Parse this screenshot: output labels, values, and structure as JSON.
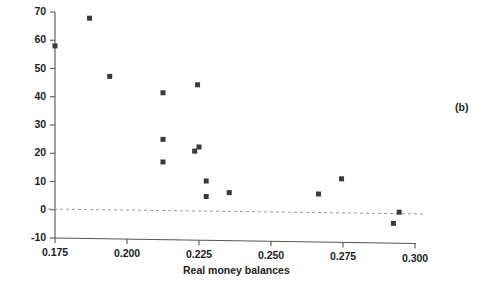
{
  "panel": {
    "tag": "(b)"
  },
  "chart_data": {
    "type": "scatter",
    "title": "",
    "xlabel": "Real money balances",
    "ylabel": "Monthly inflation rate (percent)",
    "xlim": [
      0.175,
      0.3
    ],
    "ylim": [
      -10,
      70
    ],
    "xticks": [
      0.175,
      0.2,
      0.225,
      0.25,
      0.275,
      0.3
    ],
    "xtick_labels": [
      "0.175",
      "0.200",
      "0.225",
      "0.250",
      "0.275",
      "0.300"
    ],
    "yticks": [
      -10,
      0,
      10,
      20,
      30,
      40,
      50,
      60,
      70
    ],
    "ytick_labels": [
      "-10",
      "0",
      "10",
      "20",
      "30",
      "40",
      "50",
      "60",
      "70"
    ],
    "grid": false,
    "legend": null,
    "reference_lines": [
      {
        "name": "zero-line",
        "axis": "y",
        "value": 0,
        "style": "dashed"
      }
    ],
    "marker": {
      "shape": "square",
      "color": "#3a3a3a",
      "size": 5
    },
    "x": [
      0.175,
      0.187,
      0.194,
      0.2125,
      0.2125,
      0.2125,
      0.2235,
      0.225,
      0.2245,
      0.2275,
      0.2275,
      0.2355,
      0.2665,
      0.2745,
      0.2925,
      0.2945
    ],
    "y": [
      58,
      68,
      47.5,
      42,
      25.5,
      17.5,
      21.5,
      23,
      45,
      11,
      5.5,
      7,
      7,
      12.5,
      -3,
      1
    ],
    "points": [
      {
        "x": 0.175,
        "y": 58
      },
      {
        "x": 0.187,
        "y": 68
      },
      {
        "x": 0.194,
        "y": 47.5
      },
      {
        "x": 0.2125,
        "y": 42
      },
      {
        "x": 0.2125,
        "y": 25.5
      },
      {
        "x": 0.2125,
        "y": 17.5
      },
      {
        "x": 0.2235,
        "y": 21.5
      },
      {
        "x": 0.225,
        "y": 23
      },
      {
        "x": 0.2245,
        "y": 45
      },
      {
        "x": 0.2275,
        "y": 11
      },
      {
        "x": 0.2275,
        "y": 5.5
      },
      {
        "x": 0.2355,
        "y": 7
      },
      {
        "x": 0.2665,
        "y": 7
      },
      {
        "x": 0.2745,
        "y": 12.5
      },
      {
        "x": 0.2925,
        "y": -3
      },
      {
        "x": 0.2945,
        "y": 1
      }
    ]
  }
}
